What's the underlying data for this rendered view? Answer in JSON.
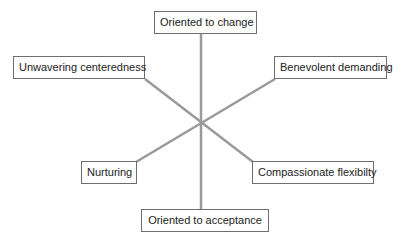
{
  "diagram": {
    "type": "six-spoke radial",
    "line_color": "#9a9a9a",
    "box_border_color": "#6e6e6e",
    "labels": {
      "top": "Oriented to change",
      "upper_left": "Unwavering centeredness",
      "upper_right": "Benevolent demanding",
      "lower_left": "Nurturing",
      "lower_right": "Compassionate flexibilty",
      "bottom": "Oriented to acceptance"
    }
  }
}
